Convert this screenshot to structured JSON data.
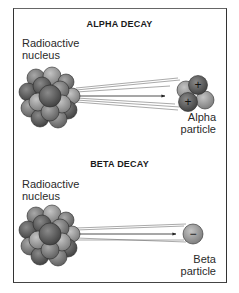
{
  "panels": [
    {
      "title": "ALPHA DECAY",
      "source_label": [
        "Radioactive",
        "nucleus"
      ],
      "particle_label": [
        "Alpha",
        "particle"
      ],
      "particle_charges": [
        "+",
        "+"
      ]
    },
    {
      "title": "BETA DECAY",
      "source_label": [
        "Radioactive",
        "nucleus"
      ],
      "particle_label": [
        "Beta",
        "particle"
      ],
      "particle_charges": [
        "−"
      ]
    }
  ],
  "colors": {
    "frame": "#333333",
    "nucleon_dark": "#5a5a5a",
    "nucleon_mid": "#7d7d7d",
    "nucleon_light": "#9a9a9a",
    "text": "#1a1a1a"
  }
}
